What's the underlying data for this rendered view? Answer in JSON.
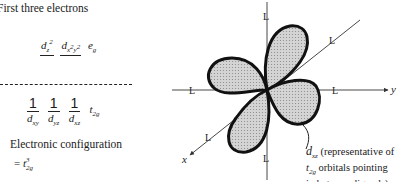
{
  "left_panel": {
    "heading": "First three electrons",
    "eg_level": {
      "orbitals": [
        {
          "base": "d",
          "sub": "z",
          "sup": "2"
        },
        {
          "base": "d",
          "sub": "x",
          "sup": "2",
          "sub2": "y",
          "sup2": "2"
        }
      ],
      "label_base": "e",
      "label_sub": "g"
    },
    "t2g_level": {
      "orbitals": [
        {
          "occupancy": "1",
          "base": "d",
          "sub": "xy"
        },
        {
          "occupancy": "1",
          "base": "d",
          "sub": "yz"
        },
        {
          "occupancy": "1",
          "base": "d",
          "sub": "xz"
        }
      ],
      "label_base": "t",
      "label_sub": "2g"
    },
    "config_label": "Electronic configuration",
    "config_value": {
      "prefix": "= ",
      "base": "t",
      "sub": "2g",
      "sup": "3"
    }
  },
  "diagram": {
    "ligand_label": "L",
    "axes": {
      "x": "x",
      "y": "y"
    },
    "orbital_name": {
      "base": "d",
      "sub": "xz"
    },
    "caption_line1": " (representative of",
    "caption_line2_base": "t",
    "caption_line2_sub": "2g",
    "caption_line2_rest": " orbitals pointing",
    "caption_line3": "in between ligands)",
    "colors": {
      "lobe_fill": "#c9c9c9",
      "lobe_edge": "#111111",
      "axis": "#333333"
    }
  }
}
